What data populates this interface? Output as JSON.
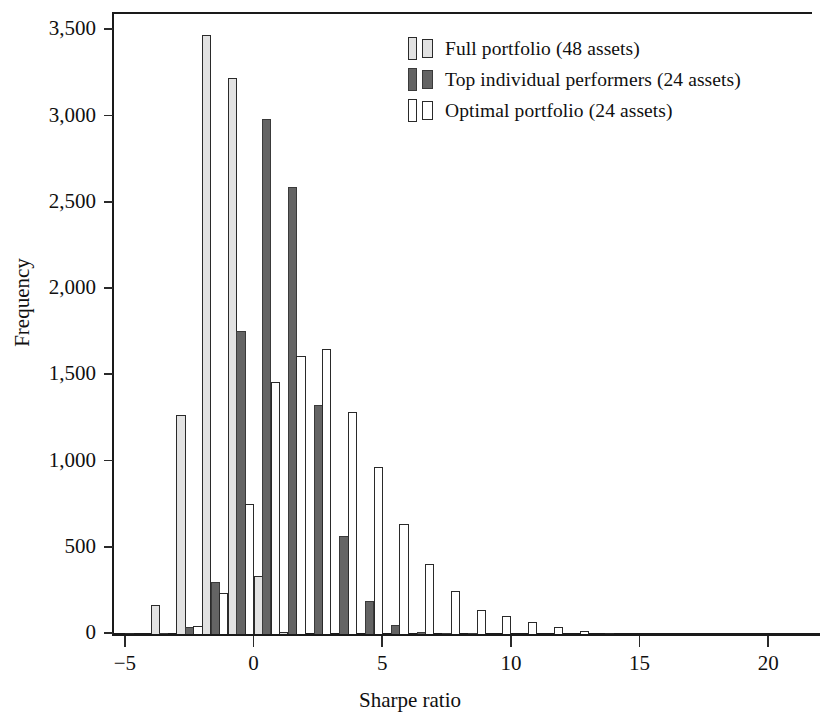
{
  "chart_data": {
    "type": "bar",
    "title": "",
    "subtitle": "",
    "xlabel": "Sharpe ratio",
    "ylabel": "Frequency",
    "xlim": [
      -5.5,
      21.7
    ],
    "ylim": [
      0,
      3600
    ],
    "grid": false,
    "legend_position": "top-right",
    "bin_width": 1.0,
    "xticks": [
      -5,
      0,
      5,
      10,
      15,
      20
    ],
    "xtick_labels": [
      "−5",
      "0",
      "5",
      "10",
      "15",
      "20"
    ],
    "yticks": [
      0,
      500,
      1000,
      1500,
      2000,
      2500,
      3000,
      3500
    ],
    "ytick_labels": [
      "0",
      "500",
      "1,000",
      "1,500",
      "2,000",
      "2,500",
      "3,000",
      "3,500"
    ],
    "bin_centers": [
      -4.5,
      -3.5,
      -2.5,
      -1.5,
      -0.5,
      0.5,
      1.5,
      2.5,
      3.5,
      4.5,
      5.5,
      6.5,
      7.5,
      8.5,
      9.5,
      10.5,
      11.5,
      12.5,
      13.5,
      14.5,
      15.5,
      16.5,
      17.5,
      18.5,
      19.5,
      20.5
    ],
    "series": [
      {
        "name": "Full portfolio (48 assets)",
        "color": "#e2e2e2",
        "edge_color": "#2a2a2a",
        "values": [
          10,
          175,
          1275,
          3480,
          3230,
          345,
          15,
          0,
          0,
          0,
          0,
          0,
          0,
          0,
          0,
          0,
          0,
          0,
          0,
          0,
          0,
          0,
          0,
          0,
          0,
          0
        ]
      },
      {
        "name": "Top individual performers (24 assets)",
        "color": "#646464",
        "edge_color": "#3a3a3a",
        "values": [
          0,
          5,
          45,
          305,
          1765,
          2990,
          2600,
          1335,
          575,
          195,
          60,
          20,
          10,
          5,
          0,
          0,
          0,
          0,
          0,
          0,
          0,
          0,
          0,
          0,
          0,
          0
        ]
      },
      {
        "name": "Optimal portfolio (24 assets)",
        "color": "#ffffff",
        "edge_color": "#2a2a2a",
        "values": [
          0,
          0,
          55,
          245,
          760,
          1465,
          1615,
          1660,
          1295,
          975,
          645,
          410,
          255,
          145,
          110,
          75,
          45,
          25,
          10,
          0,
          0,
          0,
          0,
          0,
          0,
          0
        ]
      }
    ]
  },
  "legend": {
    "entries": [
      {
        "label": "Full portfolio (48 assets)"
      },
      {
        "label": "Top individual performers (24 assets)"
      },
      {
        "label": "Optimal portfolio (24 assets)"
      }
    ]
  }
}
